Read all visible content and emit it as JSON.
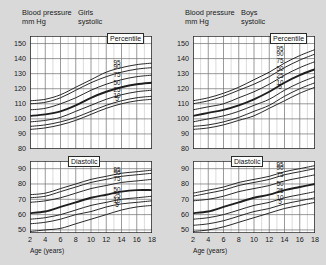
{
  "panels": [
    {
      "id": "girls",
      "header_line1": "Blood pressure",
      "header_line2": "mm Hg",
      "sex_line1": "Girls",
      "sex_line2": "systolic",
      "percentile_title": "Percentile",
      "diastolic_title": "Diastolic",
      "xlabel": "Age (years)"
    },
    {
      "id": "boys",
      "header_line1": "Blood pressure",
      "header_line2": "mm Hg",
      "sex_line1": "Boys",
      "sex_line2": "systolic",
      "percentile_title": "Percentile",
      "diastolic_title": "Diastolic",
      "xlabel": "Age (years)"
    }
  ],
  "chart_data": [
    {
      "type": "line",
      "title": "Girls systolic",
      "xlabel": "Age (years)",
      "ylabel": "Blood pressure mm Hg",
      "xlim": [
        2,
        18
      ],
      "ylim": [
        80,
        155
      ],
      "xticks": [
        2,
        4,
        6,
        8,
        10,
        12,
        14,
        16,
        18
      ],
      "yticks": [
        80,
        90,
        100,
        110,
        120,
        130,
        140,
        150
      ],
      "grid": true,
      "legend_position": "right",
      "legend_title": "Percentile",
      "x": [
        2,
        4,
        6,
        8,
        10,
        12,
        14,
        16,
        18
      ],
      "series": [
        {
          "name": "95",
          "values": [
            112,
            113,
            116,
            121,
            126,
            131,
            134,
            136,
            137
          ]
        },
        {
          "name": "90",
          "values": [
            110,
            111,
            114,
            119,
            124,
            128,
            131,
            133,
            134
          ]
        },
        {
          "name": "75",
          "values": [
            106,
            107,
            110,
            114,
            119,
            123,
            126,
            128,
            129
          ]
        },
        {
          "name": "50",
          "values": [
            102,
            103,
            105,
            109,
            114,
            118,
            121,
            123,
            124
          ]
        },
        {
          "name": "25",
          "values": [
            98,
            99,
            101,
            105,
            109,
            113,
            116,
            118,
            119
          ]
        },
        {
          "name": "10",
          "values": [
            95,
            96,
            98,
            101,
            105,
            109,
            112,
            114,
            115
          ]
        },
        {
          "name": "5",
          "values": [
            93,
            94,
            96,
            99,
            103,
            107,
            110,
            112,
            113
          ]
        }
      ]
    },
    {
      "type": "line",
      "title": "Girls diastolic",
      "xlabel": "Age (years)",
      "ylabel": "Blood pressure mm Hg",
      "xlim": [
        2,
        18
      ],
      "ylim": [
        48,
        95
      ],
      "xticks": [
        2,
        4,
        6,
        8,
        10,
        12,
        14,
        16,
        18
      ],
      "yticks": [
        50,
        60,
        70,
        80,
        90
      ],
      "grid": true,
      "legend_position": "right",
      "x": [
        2,
        4,
        6,
        8,
        10,
        12,
        14,
        16,
        18
      ],
      "series": [
        {
          "name": "95",
          "values": [
            73,
            74,
            77,
            80,
            83,
            85,
            87,
            88,
            89
          ]
        },
        {
          "name": "90",
          "values": [
            71,
            72,
            75,
            78,
            81,
            83,
            85,
            86,
            87
          ]
        },
        {
          "name": "75",
          "values": [
            68,
            69,
            71,
            74,
            77,
            79,
            81,
            82,
            83
          ]
        },
        {
          "name": "50",
          "values": [
            61,
            62,
            65,
            68,
            71,
            73,
            75,
            76,
            76
          ]
        },
        {
          "name": "25",
          "values": [
            57,
            58,
            60,
            63,
            66,
            68,
            70,
            71,
            72
          ]
        },
        {
          "name": "10",
          "values": [
            54,
            55,
            57,
            60,
            62,
            65,
            67,
            68,
            69
          ]
        },
        {
          "name": "5",
          "values": [
            49,
            50,
            51,
            54,
            57,
            60,
            63,
            65,
            66
          ]
        }
      ]
    },
    {
      "type": "line",
      "title": "Boys systolic",
      "xlabel": "Age (years)",
      "ylabel": "Blood pressure mm Hg",
      "xlim": [
        2,
        18
      ],
      "ylim": [
        80,
        155
      ],
      "xticks": [
        2,
        4,
        6,
        8,
        10,
        12,
        14,
        16,
        18
      ],
      "yticks": [
        80,
        90,
        100,
        110,
        120,
        130,
        140,
        150
      ],
      "grid": true,
      "legend_position": "right",
      "legend_title": "Percentile",
      "x": [
        2,
        4,
        6,
        8,
        10,
        12,
        14,
        16,
        18
      ],
      "series": [
        {
          "name": "95",
          "values": [
            112,
            114,
            117,
            121,
            126,
            131,
            137,
            142,
            146
          ]
        },
        {
          "name": "90",
          "values": [
            110,
            112,
            115,
            119,
            123,
            128,
            134,
            139,
            143
          ]
        },
        {
          "name": "75",
          "values": [
            106,
            108,
            110,
            114,
            118,
            123,
            129,
            134,
            138
          ]
        },
        {
          "name": "50",
          "values": [
            102,
            104,
            106,
            109,
            113,
            118,
            124,
            129,
            133
          ]
        },
        {
          "name": "25",
          "values": [
            98,
            100,
            102,
            105,
            109,
            113,
            119,
            124,
            128
          ]
        },
        {
          "name": "10",
          "values": [
            95,
            96,
            98,
            101,
            105,
            109,
            115,
            120,
            124
          ]
        },
        {
          "name": "5",
          "values": [
            93,
            94,
            96,
            99,
            102,
            107,
            112,
            117,
            121
          ]
        }
      ]
    },
    {
      "type": "line",
      "title": "Boys diastolic",
      "xlabel": "Age (years)",
      "ylabel": "Blood pressure mm Hg",
      "xlim": [
        2,
        18
      ],
      "ylim": [
        48,
        95
      ],
      "xticks": [
        2,
        4,
        6,
        8,
        10,
        12,
        14,
        16,
        18
      ],
      "yticks": [
        50,
        60,
        70,
        80,
        90
      ],
      "grid": true,
      "legend_position": "right",
      "x": [
        2,
        4,
        6,
        8,
        10,
        12,
        14,
        16,
        18
      ],
      "series": [
        {
          "name": "95",
          "values": [
            74,
            76,
            78,
            81,
            83,
            85,
            88,
            90,
            92
          ]
        },
        {
          "name": "90",
          "values": [
            72,
            74,
            76,
            79,
            81,
            83,
            86,
            88,
            90
          ]
        },
        {
          "name": "75",
          "values": [
            69,
            70,
            72,
            75,
            77,
            79,
            82,
            84,
            86
          ]
        },
        {
          "name": "50",
          "values": [
            61,
            62,
            65,
            68,
            71,
            73,
            76,
            78,
            80
          ]
        },
        {
          "name": "25",
          "values": [
            57,
            58,
            60,
            63,
            66,
            68,
            71,
            73,
            75
          ]
        },
        {
          "name": "10",
          "values": [
            53,
            54,
            56,
            59,
            62,
            64,
            67,
            69,
            71
          ]
        },
        {
          "name": "5",
          "values": [
            49,
            50,
            52,
            55,
            58,
            61,
            64,
            66,
            68
          ]
        }
      ]
    }
  ],
  "axes": {
    "systolic_yticks": [
      "150",
      "140",
      "130",
      "120",
      "110",
      "100",
      "90",
      "80"
    ],
    "diastolic_yticks": [
      "90",
      "80",
      "70",
      "60",
      "50"
    ],
    "xticks": [
      "2",
      "4",
      "6",
      "8",
      "10",
      "12",
      "14",
      "16",
      "18"
    ],
    "percentiles": [
      "95",
      "90",
      "75",
      "50",
      "25",
      "10",
      "5"
    ]
  }
}
